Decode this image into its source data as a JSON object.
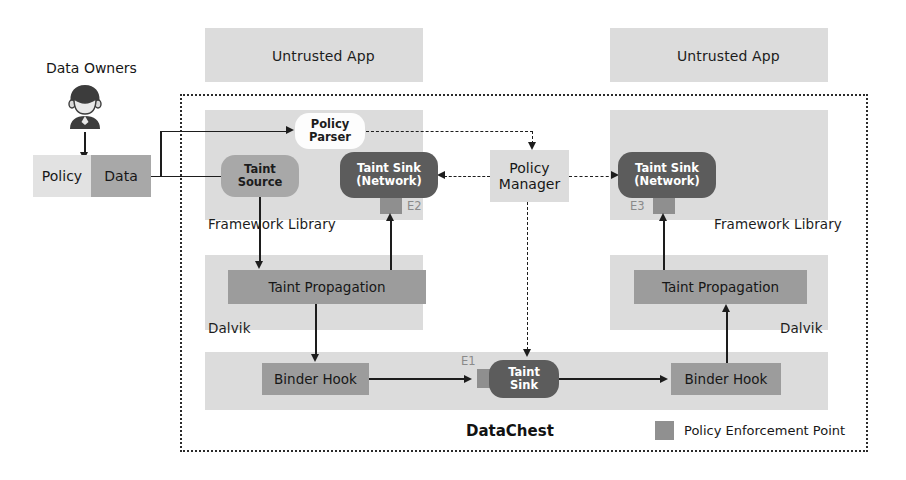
{
  "figure": {
    "system_name": "DataChest",
    "legend": {
      "swatch_color": "#909090",
      "label": "Policy Enforcement Point"
    }
  },
  "actors": {
    "owners_label": "Data Owners",
    "owner_icon": "person-icon",
    "policy_box": "Policy",
    "data_box": "Data"
  },
  "apps": {
    "left": {
      "app_title": "Untrusted App",
      "framework_label": "Framework Library",
      "dalvik_label": "Dalvik",
      "policy_parser": "Policy\nParser",
      "policy_parser_line1": "Policy",
      "policy_parser_line2": "Parser",
      "taint_source_line1": "Taint",
      "taint_source_line2": "Source",
      "taint_sink_line1": "Taint Sink",
      "taint_sink_line2": "(Network)",
      "taint_propagation": "Taint Propagation",
      "binder_hook": "Binder Hook",
      "pep_label": "E2"
    },
    "right": {
      "app_title": "Untrusted App",
      "framework_label": "Framework Library",
      "dalvik_label": "Dalvik",
      "taint_sink_line1": "Taint Sink",
      "taint_sink_line2": "(Network)",
      "taint_propagation": "Taint Propagation",
      "binder_hook": "Binder Hook",
      "pep_label": "E3"
    }
  },
  "core": {
    "policy_manager_line1": "Policy",
    "policy_manager_line2": "Manager",
    "taint_sink_line1": "Taint",
    "taint_sink_line2": "Sink",
    "pep_label": "E1"
  },
  "colors": {
    "band": "#dcdcdc",
    "node_dark": "#5c5c5c",
    "node_mid": "#a8a8a8",
    "node_white": "#fdfdfd",
    "pep": "#8f8f8f",
    "stroke": "#1d1d1d"
  }
}
